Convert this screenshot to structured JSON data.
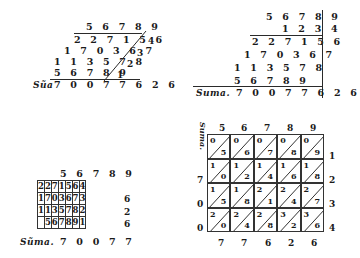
{
  "page": {
    "ink_color": "#1a1a1a",
    "paper_color": "#ffffff"
  },
  "figure1": {
    "multiplicand": "5 6 7 8 9",
    "partials": [
      "2 2 7 1 5 6",
      "1 7 0 3 6 7",
      "1 1 3 5 7 8",
      "5 6 7 8 9"
    ],
    "multipliers": [
      "4",
      "3",
      "2",
      "1"
    ],
    "sum_label": "Sũa",
    "sum": "7 0 0 7 7 6 2 6"
  },
  "figure2": {
    "multiplicand": "5 6 7 8 9",
    "multiplier": "1 2 3 4",
    "partials": [
      "2 2 7 1 5 6",
      "1 7 0 3 6 7",
      "1 1 3 5 7 8",
      "5 6 7 8 9"
    ],
    "sum_label": "Suma.",
    "sum": "7 0 0 7 7 6 2 6"
  },
  "figure3": {
    "multiplicand": "5 6 7 8 9",
    "rows": [
      [
        "2",
        "2",
        "7",
        "1",
        "5",
        "6",
        "4"
      ],
      [
        "1",
        "7",
        "0",
        "3",
        "6",
        "7",
        "3"
      ],
      [
        "1",
        "1",
        "3",
        "5",
        "7",
        "8",
        "2"
      ],
      [
        "",
        "5",
        "6",
        "7",
        "8",
        "9",
        "1"
      ]
    ],
    "outer_right": [
      "",
      "6",
      "2",
      "6"
    ],
    "sum_label": "Sũma.",
    "sum": "7 0 0 7 7"
  },
  "figure4": {
    "side_label": "Suma.",
    "top": [
      "5",
      "6",
      "7",
      "8",
      "9"
    ],
    "right": [
      "1",
      "2",
      "3",
      "4"
    ],
    "left": [
      "",
      "7",
      "0",
      "0"
    ],
    "bottom": [
      "7",
      "7",
      "6",
      "2",
      "6"
    ],
    "cells": [
      [
        [
          "0",
          "5"
        ],
        [
          "0",
          "6"
        ],
        [
          "0",
          "7"
        ],
        [
          "0",
          "8"
        ],
        [
          "0",
          "9"
        ]
      ],
      [
        [
          "1",
          "0"
        ],
        [
          "1",
          "2"
        ],
        [
          "1",
          "4"
        ],
        [
          "1",
          "6"
        ],
        [
          "1",
          "8"
        ]
      ],
      [
        [
          "1",
          "5"
        ],
        [
          "1",
          "8"
        ],
        [
          "2",
          "1"
        ],
        [
          "2",
          "4"
        ],
        [
          "2",
          "7"
        ]
      ],
      [
        [
          "2",
          "0"
        ],
        [
          "2",
          "4"
        ],
        [
          "2",
          "8"
        ],
        [
          "3",
          "2"
        ],
        [
          "3",
          "6"
        ]
      ]
    ]
  }
}
